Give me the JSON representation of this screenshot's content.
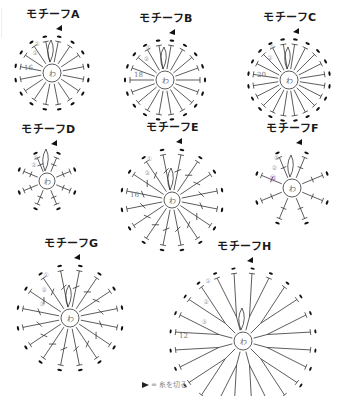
{
  "diagram": {
    "type": "crochet-motif-chart",
    "motifs": [
      {
        "id": "A",
        "title": "モチーフA",
        "center_label": "わ",
        "round_labels": [
          "①",
          "②"
        ],
        "stitch_count": "16",
        "spokes": 16,
        "cx": 52,
        "cy": 73,
        "r_inner": 9,
        "r_outer": 32,
        "style": "dc"
      },
      {
        "id": "B",
        "title": "モチーフB",
        "center_label": "わ",
        "round_labels": [
          "①",
          "②"
        ],
        "stitch_count": "18",
        "spokes": 18,
        "cx": 165,
        "cy": 80,
        "r_inner": 9,
        "r_outer": 35,
        "style": "dc"
      },
      {
        "id": "C",
        "title": "モチーフC",
        "center_label": "わ",
        "round_labels": [
          "①",
          "②"
        ],
        "stitch_count": "20",
        "spokes": 20,
        "cx": 289,
        "cy": 80,
        "r_inner": 9,
        "r_outer": 36,
        "style": "dc"
      },
      {
        "id": "D",
        "title": "モチーフD",
        "center_label": "わ",
        "round_labels": [
          "①",
          "②"
        ],
        "stitch_count": "",
        "spokes": 8,
        "cx": 47,
        "cy": 181,
        "r_inner": 8,
        "r_outer": 25,
        "style": "sc"
      },
      {
        "id": "E",
        "title": "モチーフE",
        "center_label": "わ",
        "round_labels": [
          "①",
          "②"
        ],
        "stitch_count": "16",
        "spokes": 16,
        "cx": 172,
        "cy": 200,
        "r_inner": 8,
        "r_outer": 46,
        "style": "tr"
      },
      {
        "id": "F",
        "title": "モチーフF",
        "center_label": "わ",
        "round_labels": [
          "①",
          "②",
          "⑬"
        ],
        "stitch_count": "",
        "spokes": 8,
        "cx": 292,
        "cy": 188,
        "r_inner": 9,
        "r_outer": 33,
        "style": "branch"
      },
      {
        "id": "G",
        "title": "モチーフG",
        "center_label": "わ",
        "round_labels": [
          "①",
          "②",
          "③"
        ],
        "stitch_count": "",
        "spokes": 16,
        "cx": 70,
        "cy": 318,
        "r_inner": 9,
        "r_outer": 48,
        "style": "tr-long"
      },
      {
        "id": "H",
        "title": "モチーフH",
        "center_label": "わ",
        "round_labels": [
          "①",
          "②",
          "③"
        ],
        "stitch_count": "12",
        "spokes": 12,
        "cx": 243,
        "cy": 341,
        "r_inner": 9,
        "r_outer": 68,
        "style": "pair"
      }
    ],
    "legend": {
      "symbol": "▶",
      "text": "= 糸を切る"
    },
    "colors": {
      "line": "#333333",
      "accent": "#a040b0",
      "label": "#999999",
      "title": "#1a1a1a"
    }
  }
}
